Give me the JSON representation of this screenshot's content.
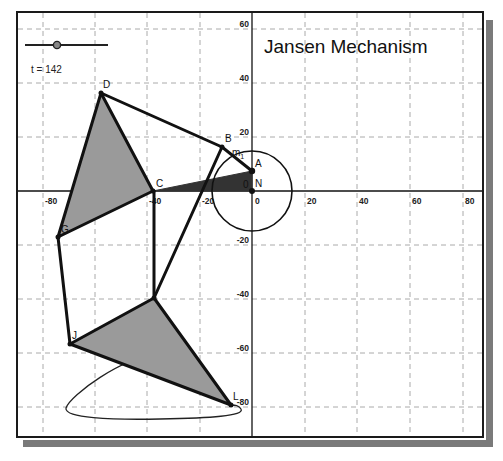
{
  "title": "Jansen Mechanism",
  "slider": {
    "label": "t = 142",
    "value": 142
  },
  "axes": {
    "x_ticks": [
      "-80",
      "-60",
      "-40",
      "-20",
      "0",
      "20",
      "40",
      "60",
      "80"
    ],
    "y_ticks": [
      "60",
      "40",
      "20",
      "-20",
      "-40",
      "-60",
      "-80"
    ],
    "x_range": [
      -80,
      80
    ],
    "y_range": [
      -80,
      60
    ],
    "grid": true
  },
  "points": {
    "A": {
      "label": "A",
      "x": 0,
      "y": 7.5
    },
    "N": {
      "label": "N",
      "x": 0,
      "y": 0
    },
    "B": {
      "label": "B",
      "x": -11.4,
      "y": 16.3
    },
    "C": {
      "label": "C",
      "x": -37.6,
      "y": 0
    },
    "D": {
      "label": "D",
      "x": -57.4,
      "y": 36.3
    },
    "G": {
      "label": "G",
      "x": -73.8,
      "y": -17
    },
    "H": {
      "label": "",
      "x": -37.3,
      "y": -39.6
    },
    "J": {
      "label": "J",
      "x": -69.2,
      "y": -56.7
    },
    "L": {
      "label": "L",
      "x": -8,
      "y": -79.3
    }
  },
  "labels": {
    "crank": "m",
    "crank_sub": "1",
    "origin_small": "0"
  },
  "crank_circle": {
    "center": "N",
    "radius": 15
  },
  "colors": {
    "link": "#111111",
    "triangle_fill": "#9a9a9a",
    "wedge_fill": "#333333",
    "grid": "#aaaaaa",
    "shadow": "#7a7a7a"
  }
}
